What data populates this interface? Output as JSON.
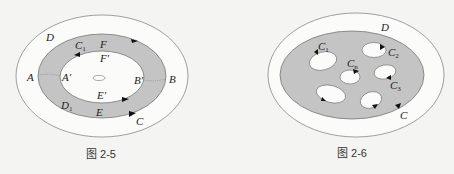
{
  "colors": {
    "background": "#f4f4f2",
    "region_fill": "#c4c4c4",
    "stroke": "#777777",
    "arrow": "#111111",
    "text": "#222222"
  },
  "figure_left": {
    "caption": "图 2-5",
    "labels": {
      "D": "D",
      "C1": "C",
      "C1_sub": "1",
      "F": "F",
      "F_prime": "F′",
      "A": "A",
      "A_prime": "A′",
      "B": "B",
      "B_prime": "B′",
      "E_prime": "E′",
      "D1": "D",
      "D1_sub": "1",
      "E": "E",
      "C": "C"
    }
  },
  "figure_right": {
    "caption": "图 2-6",
    "labels": {
      "D": "D",
      "C1": "C",
      "C1_sub": "1",
      "C2": "C",
      "C2_sub": "2",
      "Cn": "C",
      "Cn_sub": "n",
      "C3": "C",
      "C3_sub": "3",
      "C": "C"
    }
  }
}
